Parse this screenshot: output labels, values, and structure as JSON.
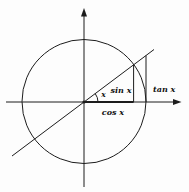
{
  "diagram": {
    "background_color": "#fdfdfd",
    "line_color": "#1c1c1c",
    "text_color": "#111111",
    "labels": {
      "angle": "x",
      "sin": "sin x",
      "cos": "cos x",
      "tan": "tan x"
    }
  }
}
